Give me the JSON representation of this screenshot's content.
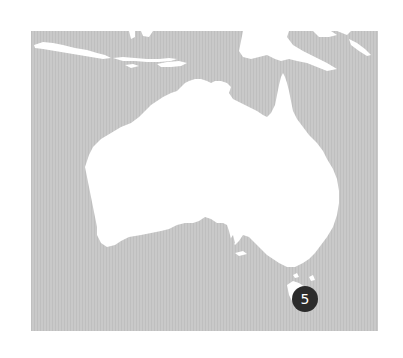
{
  "map": {
    "region": "Australia",
    "colors": {
      "sea": "#c9c9c9",
      "sea_stripe": "#bdbdbd",
      "land": "#ffffff",
      "marker_fill": "#2b2b2b",
      "marker_text": "#ffffff"
    },
    "markers": [
      {
        "label": "5",
        "location": "Tasmania (east coast)",
        "x": 305,
        "y": 299
      }
    ]
  }
}
